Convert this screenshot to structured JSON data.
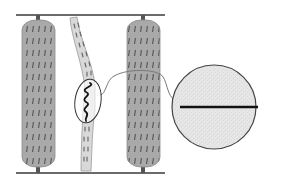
{
  "diagram": {
    "type": "schematic-illustration",
    "colors": {
      "rail": "#3a3a3a",
      "pillar_fill": "#a8a8a8",
      "pillar_texture": "#4a4a4a",
      "strand_fill": "#d8d8d8",
      "strand_marks": "#6a6a6a",
      "wavy_line": "#111111",
      "ellipse_stroke": "#333333",
      "connector": "#777777",
      "inset_fill": "#e8e8e8",
      "inset_stroke": "#444444",
      "inset_line": "#111111"
    },
    "elements": {
      "top_rail": {
        "x1": 16,
        "y": 15,
        "x2": 165
      },
      "bottom_rail": {
        "x1": 16,
        "y": 173,
        "x2": 165
      },
      "left_pillar": {
        "x": 22,
        "y": 20,
        "width": 33,
        "height": 148
      },
      "right_pillar": {
        "x": 127,
        "y": 20,
        "width": 33,
        "height": 148
      },
      "middle_strand": {
        "top": [
          81,
          16
        ],
        "bottom": [
          86,
          172
        ]
      },
      "highlight_ellipse": {
        "cx": 88,
        "cy": 101,
        "rx": 14,
        "ry": 22
      },
      "inset_circle": {
        "cx": 214,
        "cy": 107,
        "r": 42
      }
    }
  }
}
